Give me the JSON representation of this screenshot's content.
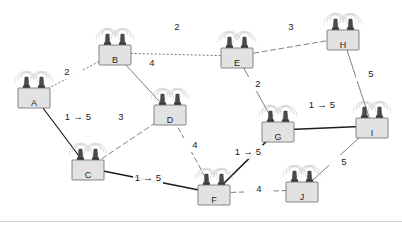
{
  "diagram": {
    "canvas": {
      "width": 402,
      "height": 227
    },
    "colors": {
      "background": "#ffffff",
      "node_fill": "#e2e2e2",
      "node_stroke": "#6b6b6b",
      "edge_default": "#6f6f6f",
      "edge_upgraded": "#1d1d1d",
      "label_text": "#1d1d1d",
      "antenna_ring": "#b9b9b9",
      "antenna_mast": "#4a4a4a",
      "footer_rule": "#d4d4d4"
    },
    "nodes": [
      {
        "id": "A",
        "label": "A",
        "x": 34,
        "y": 98
      },
      {
        "id": "B",
        "label": "B",
        "x": 115,
        "y": 55
      },
      {
        "id": "C",
        "label": "C",
        "x": 88,
        "y": 170
      },
      {
        "id": "D",
        "label": "D",
        "x": 170,
        "y": 115
      },
      {
        "id": "E",
        "label": "E",
        "x": 237,
        "y": 58
      },
      {
        "id": "F",
        "label": "F",
        "x": 214,
        "y": 195
      },
      {
        "id": "G",
        "label": "G",
        "x": 278,
        "y": 132
      },
      {
        "id": "H",
        "label": "H",
        "x": 343,
        "y": 40
      },
      {
        "id": "I",
        "label": "I",
        "x": 372,
        "y": 128
      },
      {
        "id": "J",
        "label": "J",
        "x": 302,
        "y": 192
      }
    ],
    "edges": [
      {
        "from": "A",
        "to": "B",
        "weight": "2",
        "style": "dotted",
        "thickness": "thin",
        "label_x": 67,
        "label_y": 72
      },
      {
        "from": "A",
        "to": "C",
        "weight": "1 → 5",
        "style": "solid",
        "thickness": "medium",
        "label_x": 78,
        "label_y": 117
      },
      {
        "from": "B",
        "to": "E",
        "weight": "2",
        "style": "dotted",
        "thickness": "thin",
        "label_x": 177,
        "label_y": 27
      },
      {
        "from": "B",
        "to": "D",
        "weight": "4",
        "style": "solid",
        "thickness": "thin",
        "label_x": 152,
        "label_y": 63
      },
      {
        "from": "C",
        "to": "D",
        "weight": "3",
        "style": "dashed",
        "thickness": "thin",
        "label_x": 121,
        "label_y": 117
      },
      {
        "from": "C",
        "to": "F",
        "weight": "1 → 5",
        "style": "solid",
        "thickness": "bold",
        "label_x": 148,
        "label_y": 178
      },
      {
        "from": "D",
        "to": "F",
        "weight": "4",
        "style": "dashed",
        "thickness": "thin",
        "label_x": 195,
        "label_y": 145
      },
      {
        "from": "E",
        "to": "H",
        "weight": "3",
        "style": "dashed",
        "thickness": "thin",
        "label_x": 291,
        "label_y": 27
      },
      {
        "from": "E",
        "to": "G",
        "weight": "2",
        "style": "solid",
        "thickness": "thin",
        "label_x": 258,
        "label_y": 84
      },
      {
        "from": "F",
        "to": "G",
        "weight": "1 → 5",
        "style": "solid",
        "thickness": "bold",
        "label_x": 248,
        "label_y": 152
      },
      {
        "from": "F",
        "to": "J",
        "weight": "4",
        "style": "dashed",
        "thickness": "thin",
        "label_x": 259,
        "label_y": 189
      },
      {
        "from": "G",
        "to": "I",
        "weight": "1 → 5",
        "style": "solid",
        "thickness": "bold",
        "label_x": 322,
        "label_y": 105
      },
      {
        "from": "H",
        "to": "I",
        "weight": "5",
        "style": "solid",
        "thickness": "thin",
        "label_x": 371,
        "label_y": 74
      },
      {
        "from": "I",
        "to": "J",
        "weight": "5",
        "style": "solid",
        "thickness": "thin",
        "label_x": 344,
        "label_y": 162
      }
    ]
  }
}
